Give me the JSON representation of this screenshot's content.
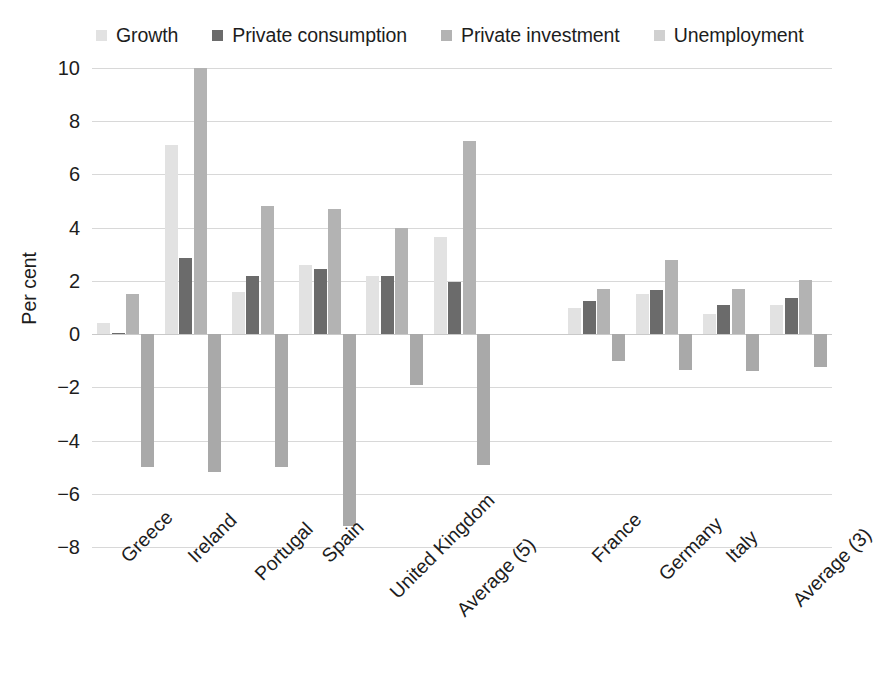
{
  "chart_data": {
    "type": "bar",
    "title": "",
    "subtitle": "",
    "xlabel": "",
    "ylabel": "Per cent",
    "ylim": [
      -8,
      10
    ],
    "yticks": [
      10,
      8,
      6,
      4,
      2,
      0,
      -2,
      -4,
      -6,
      -8
    ],
    "ytick_labels": [
      "10",
      "8",
      "6",
      "4",
      "2",
      "0",
      "−2",
      "−4",
      "−6",
      "−8"
    ],
    "grid": true,
    "legend_position": "top",
    "categories": [
      "Greece",
      "Ireland",
      "Portugal",
      "Spain",
      "United Kingdom",
      "Average (5)",
      "",
      "France",
      "Germany",
      "Italy",
      "Average (3)"
    ],
    "group_gap_after_index": 5,
    "series": [
      {
        "name": "Growth",
        "color": "#e2e2e2",
        "values": [
          0.4,
          7.1,
          1.6,
          2.6,
          2.2,
          3.65,
          null,
          1.0,
          1.5,
          0.75,
          1.1
        ]
      },
      {
        "name": "Private consumption",
        "color": "#6b6b6b",
        "values": [
          0.05,
          2.85,
          2.2,
          2.45,
          2.2,
          1.95,
          null,
          1.25,
          1.65,
          1.1,
          1.35
        ]
      },
      {
        "name": "Private investment",
        "color": "#b3b3b3",
        "values": [
          1.5,
          10.0,
          4.8,
          4.7,
          4.0,
          7.25,
          null,
          1.7,
          2.8,
          1.7,
          2.05
        ]
      },
      {
        "name": "Unemployment",
        "color": "#a9a9a9",
        "values": [
          -5.0,
          -5.2,
          -5.0,
          -7.2,
          -1.9,
          -4.9,
          null,
          -1.0,
          -1.35,
          -1.4,
          -1.25
        ]
      }
    ]
  },
  "legend": {
    "items": [
      {
        "label": "Growth",
        "color": "#e2e2e2"
      },
      {
        "label": "Private consumption",
        "color": "#6b6b6b"
      },
      {
        "label": "Private investment",
        "color": "#b3b3b3"
      },
      {
        "label": "Unemployment",
        "color": "#d0d0d0"
      }
    ]
  },
  "axis": {
    "y_title": "Per cent"
  }
}
